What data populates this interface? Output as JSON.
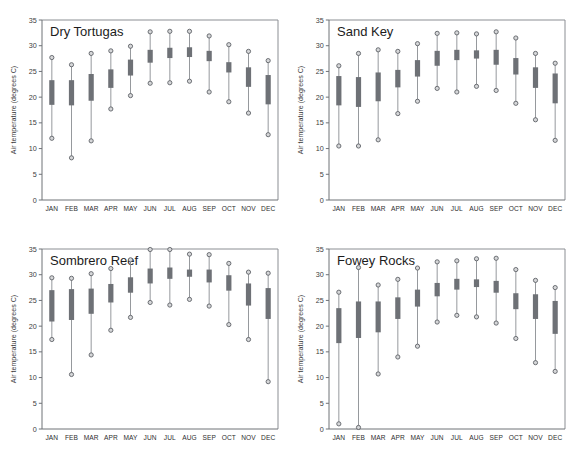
{
  "figure": {
    "width": 574,
    "height": 458,
    "background": "#ffffff",
    "panel_count": 4,
    "marker_color": "#6e7176",
    "whisker_color": "#8a8d92",
    "axis_color": "#6f7277"
  },
  "axis": {
    "ylabel": "Air temperature (degrees C)",
    "yticks": [
      0,
      5,
      10,
      15,
      20,
      25,
      30,
      35
    ],
    "ytick_labels": [
      "0",
      "5",
      "10",
      "15",
      "20",
      "25",
      "30",
      "35"
    ],
    "ylim": [
      0,
      35
    ],
    "xtick_labels": [
      "JAN",
      "FEB",
      "MAR",
      "APR",
      "MAY",
      "JUN",
      "JUL",
      "AUG",
      "SEP",
      "OCT",
      "NOV",
      "DEC"
    ],
    "grid": "off",
    "legend": "none"
  },
  "chart_data": [
    {
      "type": "box",
      "title": "Dry Tortugas",
      "xlabel": "",
      "ylabel": "Air temperature (degrees C)",
      "ylim": [
        0,
        35
      ],
      "yticks": [
        0,
        5,
        10,
        15,
        20,
        25,
        30,
        35
      ],
      "categories": [
        "JAN",
        "FEB",
        "MAR",
        "APR",
        "MAY",
        "JUN",
        "JUL",
        "AUG",
        "SEP",
        "OCT",
        "NOV",
        "DEC"
      ],
      "series": [
        {
          "name": "max",
          "values": [
            27.7,
            26.3,
            28.5,
            29.0,
            29.9,
            32.7,
            32.8,
            32.8,
            31.9,
            30.2,
            28.9,
            27.1
          ]
        },
        {
          "name": "q3",
          "values": [
            23.3,
            23.3,
            24.5,
            25.4,
            27.3,
            29.2,
            29.6,
            29.7,
            29.0,
            26.8,
            25.8,
            24.3
          ]
        },
        {
          "name": "q1",
          "values": [
            18.5,
            18.4,
            19.3,
            21.8,
            24.2,
            26.7,
            27.6,
            27.8,
            27.0,
            24.8,
            22.0,
            18.6
          ]
        },
        {
          "name": "min",
          "values": [
            12.0,
            8.2,
            11.5,
            17.7,
            20.3,
            22.7,
            22.8,
            23.1,
            21.0,
            19.1,
            16.9,
            12.7
          ]
        }
      ]
    },
    {
      "type": "box",
      "title": "Sand Key",
      "xlabel": "",
      "ylabel": "Air temperature (degrees C)",
      "ylim": [
        0,
        35
      ],
      "yticks": [
        0,
        5,
        10,
        15,
        20,
        25,
        30,
        35
      ],
      "categories": [
        "JAN",
        "FEB",
        "MAR",
        "APR",
        "MAY",
        "JUN",
        "JUL",
        "AUG",
        "SEP",
        "OCT",
        "NOV",
        "DEC"
      ],
      "series": [
        {
          "name": "max",
          "values": [
            26.1,
            28.5,
            29.2,
            28.9,
            30.4,
            32.4,
            32.5,
            32.3,
            32.7,
            31.5,
            28.5,
            26.6
          ]
        },
        {
          "name": "q3",
          "values": [
            24.1,
            23.9,
            24.8,
            25.3,
            27.2,
            29.0,
            29.2,
            29.1,
            29.2,
            27.6,
            25.8,
            24.6
          ]
        },
        {
          "name": "q1",
          "values": [
            18.4,
            18.1,
            19.2,
            21.9,
            24.0,
            26.1,
            27.2,
            27.5,
            26.3,
            24.4,
            21.8,
            18.8
          ]
        },
        {
          "name": "min",
          "values": [
            10.5,
            10.5,
            11.7,
            16.8,
            19.2,
            21.7,
            21.0,
            22.1,
            21.3,
            18.8,
            15.6,
            11.6
          ]
        }
      ]
    },
    {
      "type": "box",
      "title": "Sombrero Reef",
      "xlabel": "",
      "ylabel": "Air temperature (degrees C)",
      "ylim": [
        0,
        35
      ],
      "yticks": [
        0,
        5,
        10,
        15,
        20,
        25,
        30,
        35
      ],
      "categories": [
        "JAN",
        "FEB",
        "MAR",
        "APR",
        "MAY",
        "JUN",
        "JUL",
        "AUG",
        "SEP",
        "OCT",
        "NOV",
        "DEC"
      ],
      "series": [
        {
          "name": "max",
          "values": [
            29.4,
            29.3,
            30.2,
            31.2,
            32.9,
            34.9,
            34.9,
            34.0,
            33.9,
            32.2,
            30.5,
            30.3
          ]
        },
        {
          "name": "q3",
          "values": [
            27.0,
            27.2,
            27.3,
            28.2,
            29.5,
            31.2,
            31.4,
            31.0,
            31.0,
            29.9,
            28.3,
            27.4
          ]
        },
        {
          "name": "q1",
          "values": [
            20.9,
            21.2,
            22.4,
            24.6,
            26.5,
            28.3,
            29.2,
            29.6,
            28.5,
            26.9,
            24.0,
            21.4
          ]
        },
        {
          "name": "min",
          "values": [
            17.4,
            10.6,
            14.4,
            19.2,
            21.7,
            24.6,
            24.1,
            25.2,
            23.9,
            20.3,
            17.4,
            9.2
          ]
        }
      ]
    },
    {
      "type": "box",
      "title": "Fowey Rocks",
      "xlabel": "",
      "ylabel": "Air temperature (degrees C)",
      "ylim": [
        0,
        35
      ],
      "yticks": [
        0,
        5,
        10,
        15,
        20,
        25,
        30,
        35
      ],
      "categories": [
        "JAN",
        "FEB",
        "MAR",
        "APR",
        "MAY",
        "JUN",
        "JUL",
        "AUG",
        "SEP",
        "OCT",
        "NOV",
        "DEC"
      ],
      "series": [
        {
          "name": "max",
          "values": [
            26.6,
            31.4,
            28.0,
            29.1,
            31.3,
            32.5,
            32.7,
            33.1,
            33.2,
            31.0,
            28.9,
            27.5
          ]
        },
        {
          "name": "q3",
          "values": [
            23.5,
            24.8,
            24.8,
            25.6,
            27.1,
            28.4,
            29.2,
            29.1,
            28.8,
            26.4,
            26.2,
            24.9
          ]
        },
        {
          "name": "q1",
          "values": [
            16.7,
            17.7,
            18.8,
            21.4,
            23.8,
            25.8,
            27.1,
            27.6,
            26.5,
            23.3,
            21.4,
            18.5
          ]
        },
        {
          "name": "min",
          "values": [
            1.0,
            0.3,
            10.7,
            14.0,
            16.1,
            20.8,
            22.1,
            21.8,
            20.6,
            17.6,
            12.9,
            11.2
          ]
        }
      ]
    }
  ]
}
